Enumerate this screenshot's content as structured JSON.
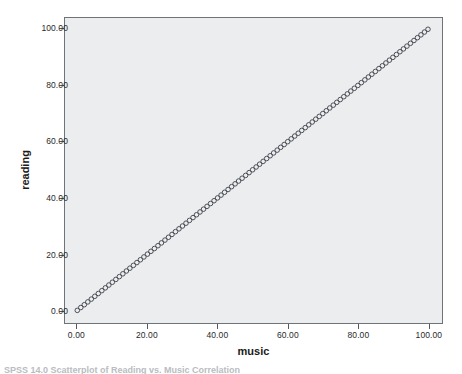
{
  "figure": {
    "background": "#ffffff",
    "plot_background": "#ecedef",
    "frame_color": "#6e7378",
    "marker_color": "#4a4f55",
    "caption_clipped": "SPSS 14.0  Scatterplot of Reading vs. Music  Correlation"
  },
  "chart_data": {
    "type": "scatter",
    "title": "",
    "xlabel": "music",
    "ylabel": "reading",
    "xlim": [
      -3.5,
      104
    ],
    "ylim": [
      -4.5,
      104
    ],
    "grid": false,
    "legend": null,
    "xticks": [
      0,
      20,
      40,
      60,
      80,
      100
    ],
    "yticks": [
      0,
      20,
      40,
      60,
      80,
      100
    ],
    "xticklabels": [
      "0.00",
      "20.00",
      "40.00",
      "60.00",
      "80.00",
      "100.00"
    ],
    "yticklabels": [
      "0.00",
      "20.00",
      "40.00",
      "60.00",
      "80.00",
      "100.00"
    ],
    "marker": "open-circle",
    "marker_size": 4.6,
    "relationship": "perfect positive linear (y = x)",
    "x": [
      0,
      1,
      2,
      3,
      4,
      5,
      6,
      7,
      8,
      9,
      10,
      11,
      12,
      13,
      14,
      15,
      16,
      17,
      18,
      19,
      20,
      21,
      22,
      23,
      24,
      25,
      26,
      27,
      28,
      29,
      30,
      31,
      32,
      33,
      34,
      35,
      36,
      37,
      38,
      39,
      40,
      41,
      42,
      43,
      44,
      45,
      46,
      47,
      48,
      49,
      50,
      51,
      52,
      53,
      54,
      55,
      56,
      57,
      58,
      59,
      60,
      61,
      62,
      63,
      64,
      65,
      66,
      67,
      68,
      69,
      70,
      71,
      72,
      73,
      74,
      75,
      76,
      77,
      78,
      79,
      80,
      81,
      82,
      83,
      84,
      85,
      86,
      87,
      88,
      89,
      90,
      91,
      92,
      93,
      94,
      95,
      96,
      97,
      98,
      99,
      100
    ],
    "y": [
      0,
      1,
      2,
      3,
      4,
      5,
      6,
      7,
      8,
      9,
      10,
      11,
      12,
      13,
      14,
      15,
      16,
      17,
      18,
      19,
      20,
      21,
      22,
      23,
      24,
      25,
      26,
      27,
      28,
      29,
      30,
      31,
      32,
      33,
      34,
      35,
      36,
      37,
      38,
      39,
      40,
      41,
      42,
      43,
      44,
      45,
      46,
      47,
      48,
      49,
      50,
      51,
      52,
      53,
      54,
      55,
      56,
      57,
      58,
      59,
      60,
      61,
      62,
      63,
      64,
      65,
      66,
      67,
      68,
      69,
      70,
      71,
      72,
      73,
      74,
      75,
      76,
      77,
      78,
      79,
      80,
      81,
      82,
      83,
      84,
      85,
      86,
      87,
      88,
      89,
      90,
      91,
      92,
      93,
      94,
      95,
      96,
      97,
      98,
      99,
      100
    ]
  }
}
